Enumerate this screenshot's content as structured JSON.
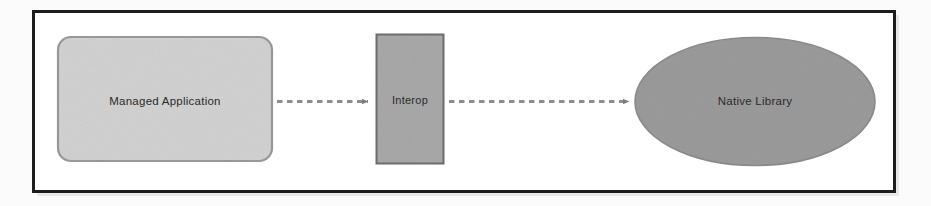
{
  "figure": {
    "kind": "block-diagram",
    "background_color": "#fbfbfb",
    "frame_color": "#1d1d1d"
  },
  "nodes": [
    {
      "id": "managed-application",
      "label": "Managed Application",
      "shape": "rounded-rectangle",
      "fill": "#d2d2d2",
      "stroke": "#9a9a9a",
      "text_color": "#2b2b2b"
    },
    {
      "id": "interop",
      "label": "Interop",
      "shape": "rectangle",
      "fill": "#a9a9a9",
      "stroke": "#6e6e6e",
      "text_color": "#262626"
    },
    {
      "id": "native-library",
      "label": "Native Library",
      "shape": "ellipse",
      "fill": "#9b9b9b",
      "stroke": "#8a8a8a",
      "text_color": "#232323"
    }
  ],
  "connectors": [
    {
      "id": "managed-application-to-interop",
      "from": "managed-application",
      "to": "interop",
      "style": "dashed",
      "arrowhead": "solid-triangle",
      "color": "#8d8d8d",
      "label": ""
    },
    {
      "id": "interop-to-native-library",
      "from": "interop",
      "to": "native-library",
      "style": "dashed",
      "arrowhead": "solid-triangle",
      "color": "#8d8d8d",
      "label": ""
    }
  ]
}
